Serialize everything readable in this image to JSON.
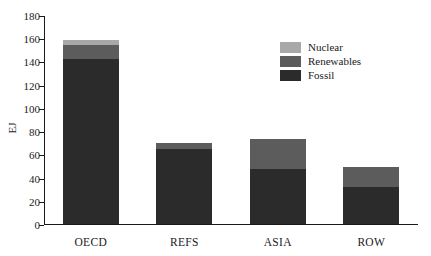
{
  "chart_data": {
    "type": "bar",
    "subtype": "stacked-bar",
    "title": "",
    "xlabel": "",
    "ylabel": "EJ",
    "categories": [
      "OECD",
      "REFS",
      "ASIA",
      "ROW"
    ],
    "series": [
      {
        "name": "Fossil",
        "color": "#2b2b2b",
        "values": [
          142,
          65,
          47,
          32
        ]
      },
      {
        "name": "Renewables",
        "color": "#5c5c5c",
        "values": [
          12,
          4.5,
          26.5,
          17.5
        ]
      },
      {
        "name": "Nuclear",
        "color": "#a8a8a8",
        "values": [
          4.5,
          0.5,
          0,
          0
        ]
      }
    ],
    "totals": [
      158.5,
      70,
      73.5,
      49.5
    ],
    "ylim": [
      0,
      180
    ],
    "yticks": [
      0,
      20,
      40,
      60,
      80,
      100,
      120,
      140,
      160,
      180
    ],
    "ytick_labels": [
      "0",
      "20",
      "40",
      "60",
      "80",
      "100",
      "120",
      "140",
      "160",
      "180"
    ],
    "grid": false,
    "legend_position": "top-right-inside",
    "legend_order": [
      "Nuclear",
      "Renewables",
      "Fossil"
    ],
    "background": "#ffffff",
    "axis_color": "#1a1a1a"
  },
  "legend": {
    "entries": [
      {
        "label": "Nuclear",
        "color": "#a8a8a8"
      },
      {
        "label": "Renewables",
        "color": "#5c5c5c"
      },
      {
        "label": "Fossil",
        "color": "#2b2b2b"
      }
    ]
  },
  "axes": {
    "y_title": "EJ"
  }
}
